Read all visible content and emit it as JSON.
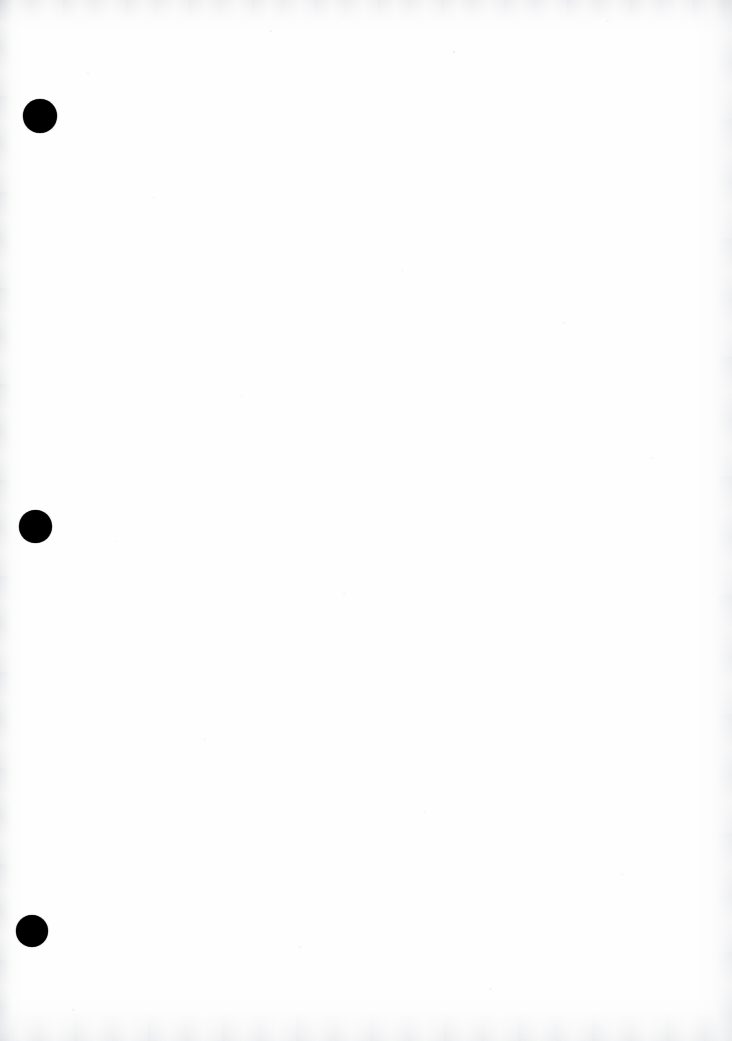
{
  "page": {
    "kind": "scanned-document-page",
    "width": 732,
    "height": 1041,
    "background_color": "#fefefe",
    "ink_color": "#000000",
    "content_text": "",
    "note": "Blank scanned page bearing three solid black registration dots down the left margin."
  },
  "marks": {
    "label": "margin-registration-dots",
    "count": 3,
    "items": [
      {
        "name": "dot-top",
        "cx": 40,
        "cy": 116,
        "diameter": 34,
        "color": "#000000"
      },
      {
        "name": "dot-middle",
        "cx": 35.5,
        "cy": 526,
        "diameter": 33,
        "color": "#000000"
      },
      {
        "name": "dot-bottom",
        "cx": 32,
        "cy": 931,
        "diameter": 32,
        "color": "#000000"
      }
    ]
  },
  "artifacts": {
    "left_edge_streak": true,
    "right_edge_streak": true,
    "top_smudge_band": true,
    "bottom_smudge_band": true,
    "paper_grain": true
  }
}
